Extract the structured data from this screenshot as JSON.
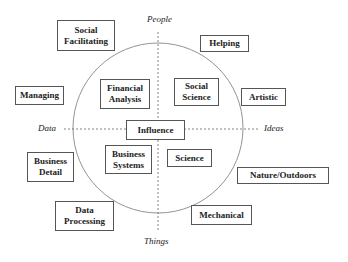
{
  "diagram": {
    "type": "circumplex",
    "axes": {
      "top": "People",
      "bottom": "Things",
      "left": "Data",
      "right": "Ideas"
    },
    "center": "Influence",
    "inner_boxes": [
      {
        "id": "financial-analysis",
        "label": "Financial Analysis"
      },
      {
        "id": "social-science",
        "label": "Social Science"
      },
      {
        "id": "business-systems",
        "label": "Business Systems"
      },
      {
        "id": "science",
        "label": "Science"
      }
    ],
    "outer_boxes": [
      {
        "id": "social-facilitating",
        "label": "Social Facilitating"
      },
      {
        "id": "helping",
        "label": "Helping"
      },
      {
        "id": "managing",
        "label": "Managing"
      },
      {
        "id": "artistic",
        "label": "Artistic"
      },
      {
        "id": "business-detail",
        "label": "Business Detail"
      },
      {
        "id": "nature-outdoors",
        "label": "Nature/Outdoors"
      },
      {
        "id": "data-processing",
        "label": "Data Processing"
      },
      {
        "id": "mechanical",
        "label": "Mechanical"
      }
    ]
  }
}
